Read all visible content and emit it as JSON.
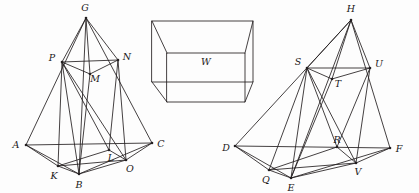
{
  "figure": {
    "background_color": "#fdfdfd",
    "stroke_color": "#231f20",
    "label_color": "#1a1718"
  },
  "left_solid": {
    "name": "left-tetrahedron",
    "vertices": [
      {
        "id": "G",
        "label": "G",
        "x": 86,
        "y": 18,
        "label_x": 85,
        "label_y": 8,
        "dot": true
      },
      {
        "id": "P",
        "label": "P",
        "x": 62,
        "y": 62,
        "label_x": 52,
        "label_y": 58,
        "dot": true
      },
      {
        "id": "N",
        "label": "N",
        "x": 118,
        "y": 60,
        "label_x": 127,
        "label_y": 57,
        "dot": true
      },
      {
        "id": "M",
        "label": "M",
        "x": 90,
        "y": 74,
        "label_x": 95,
        "label_y": 79,
        "dot": true
      },
      {
        "id": "A",
        "label": "A",
        "x": 26,
        "y": 145,
        "label_x": 16,
        "label_y": 145,
        "dot": true
      },
      {
        "id": "C",
        "label": "C",
        "x": 152,
        "y": 143,
        "label_x": 161,
        "label_y": 144,
        "dot": true
      },
      {
        "id": "K",
        "label": "K",
        "x": 58,
        "y": 166,
        "label_x": 54,
        "label_y": 176,
        "dot": true
      },
      {
        "id": "B",
        "label": "B",
        "x": 79,
        "y": 174,
        "label_x": 79,
        "label_y": 185,
        "dot": true
      },
      {
        "id": "L",
        "label": "L",
        "x": 109,
        "y": 150,
        "label_x": 111,
        "label_y": 158,
        "dot": true
      },
      {
        "id": "O",
        "label": "O",
        "x": 126,
        "y": 160,
        "label_x": 130,
        "label_y": 169,
        "dot": true
      }
    ],
    "edges": [
      [
        "G",
        "A"
      ],
      [
        "G",
        "C"
      ],
      [
        "G",
        "B"
      ],
      [
        "A",
        "C"
      ],
      [
        "A",
        "K"
      ],
      [
        "A",
        "B"
      ],
      [
        "C",
        "O"
      ],
      [
        "C",
        "B"
      ],
      [
        "K",
        "B"
      ],
      [
        "B",
        "O"
      ],
      [
        "K",
        "O"
      ],
      [
        "P",
        "N"
      ],
      [
        "P",
        "M"
      ],
      [
        "M",
        "N"
      ],
      [
        "P",
        "K"
      ],
      [
        "P",
        "B"
      ],
      [
        "P",
        "L"
      ],
      [
        "P",
        "O"
      ],
      [
        "N",
        "O"
      ],
      [
        "N",
        "L"
      ],
      [
        "M",
        "B"
      ],
      [
        "K",
        "L"
      ],
      [
        "L",
        "O"
      ],
      [
        "G",
        "P"
      ],
      [
        "G",
        "N"
      ],
      [
        "G",
        "M"
      ]
    ]
  },
  "middle_solid": {
    "name": "rectangular-box",
    "label": "W",
    "label_x": 206,
    "label_y": 62,
    "front_face": [
      {
        "x": 167,
        "y": 53
      },
      {
        "x": 245,
        "y": 53
      },
      {
        "x": 245,
        "y": 102
      },
      {
        "x": 167,
        "y": 102
      }
    ],
    "back_face": [
      {
        "x": 152,
        "y": 21
      },
      {
        "x": 253,
        "y": 21
      },
      {
        "x": 253,
        "y": 82
      },
      {
        "x": 152,
        "y": 82
      }
    ],
    "connectors": [
      [
        [
          167,
          53
        ],
        [
          152,
          21
        ]
      ],
      [
        [
          245,
          53
        ],
        [
          253,
          21
        ]
      ],
      [
        [
          245,
          102
        ],
        [
          253,
          82
        ]
      ],
      [
        [
          167,
          102
        ],
        [
          152,
          82
        ]
      ]
    ]
  },
  "right_solid": {
    "name": "right-tetrahedron",
    "vertices": [
      {
        "id": "H",
        "label": "H",
        "x": 351,
        "y": 20,
        "label_x": 351,
        "label_y": 9,
        "dot": true
      },
      {
        "id": "S",
        "label": "S",
        "x": 307,
        "y": 68,
        "label_x": 298,
        "label_y": 62,
        "dot": true
      },
      {
        "id": "U",
        "label": "U",
        "x": 370,
        "y": 68,
        "label_x": 379,
        "label_y": 64,
        "dot": true
      },
      {
        "id": "T",
        "label": "T",
        "x": 332,
        "y": 79,
        "label_x": 338,
        "label_y": 84,
        "dot": true
      },
      {
        "id": "D",
        "label": "D",
        "x": 235,
        "y": 146,
        "label_x": 226,
        "label_y": 148,
        "dot": true
      },
      {
        "id": "F",
        "label": "F",
        "x": 390,
        "y": 148,
        "label_x": 399,
        "label_y": 149,
        "dot": true
      },
      {
        "id": "Q",
        "label": "Q",
        "x": 269,
        "y": 170,
        "label_x": 266,
        "label_y": 180,
        "dot": true
      },
      {
        "id": "E",
        "label": "E",
        "x": 291,
        "y": 178,
        "label_x": 291,
        "label_y": 188,
        "dot": true
      },
      {
        "id": "R",
        "label": "R",
        "x": 337,
        "y": 147,
        "label_x": 337,
        "label_y": 140,
        "dot": true
      },
      {
        "id": "V",
        "label": "V",
        "x": 356,
        "y": 163,
        "label_x": 358,
        "label_y": 172,
        "dot": true
      }
    ],
    "edges": [
      [
        "H",
        "D"
      ],
      [
        "H",
        "F"
      ],
      [
        "H",
        "E"
      ],
      [
        "D",
        "F"
      ],
      [
        "D",
        "Q"
      ],
      [
        "D",
        "E"
      ],
      [
        "F",
        "V"
      ],
      [
        "F",
        "E"
      ],
      [
        "Q",
        "E"
      ],
      [
        "E",
        "V"
      ],
      [
        "Q",
        "V"
      ],
      [
        "S",
        "U"
      ],
      [
        "S",
        "T"
      ],
      [
        "T",
        "U"
      ],
      [
        "S",
        "Q"
      ],
      [
        "S",
        "E"
      ],
      [
        "S",
        "R"
      ],
      [
        "S",
        "V"
      ],
      [
        "U",
        "V"
      ],
      [
        "U",
        "R"
      ],
      [
        "T",
        "E"
      ],
      [
        "Q",
        "R"
      ],
      [
        "R",
        "V"
      ],
      [
        "H",
        "S"
      ],
      [
        "H",
        "U"
      ],
      [
        "H",
        "T"
      ]
    ]
  }
}
